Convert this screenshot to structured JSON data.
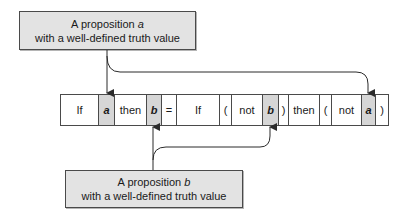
{
  "top_note": {
    "line1_prefix": "A proposition ",
    "line1_var": "a",
    "line2": "with a well-defined truth value"
  },
  "bottom_note": {
    "line1_prefix": "A proposition ",
    "line1_var": "b",
    "line2": "with a well-defined truth value"
  },
  "expression": {
    "cells": [
      {
        "text": "If",
        "var": false,
        "width": 38
      },
      {
        "text": "a",
        "var": true,
        "width": 16
      },
      {
        "text": "then",
        "var": false,
        "width": 32
      },
      {
        "text": "b",
        "var": true,
        "width": 15
      },
      {
        "text": "=",
        "var": false,
        "width": 15
      },
      {
        "text": "If",
        "var": false,
        "width": 43
      },
      {
        "text": "(",
        "var": false,
        "width": 12
      },
      {
        "text": "not",
        "var": false,
        "width": 31
      },
      {
        "text": "b",
        "var": true,
        "width": 16
      },
      {
        "text": ")",
        "var": false,
        "width": 10
      },
      {
        "text": "then",
        "var": false,
        "width": 31
      },
      {
        "text": "(",
        "var": false,
        "width": 12
      },
      {
        "text": "not",
        "var": false,
        "width": 30
      },
      {
        "text": "a",
        "var": true,
        "width": 14
      },
      {
        "text": ")",
        "var": false,
        "width": 13
      }
    ]
  },
  "colors": {
    "box_fill": "#e3e3e3",
    "var_cell_fill": "#d6d6d6",
    "stroke": "#2b2b2b"
  }
}
